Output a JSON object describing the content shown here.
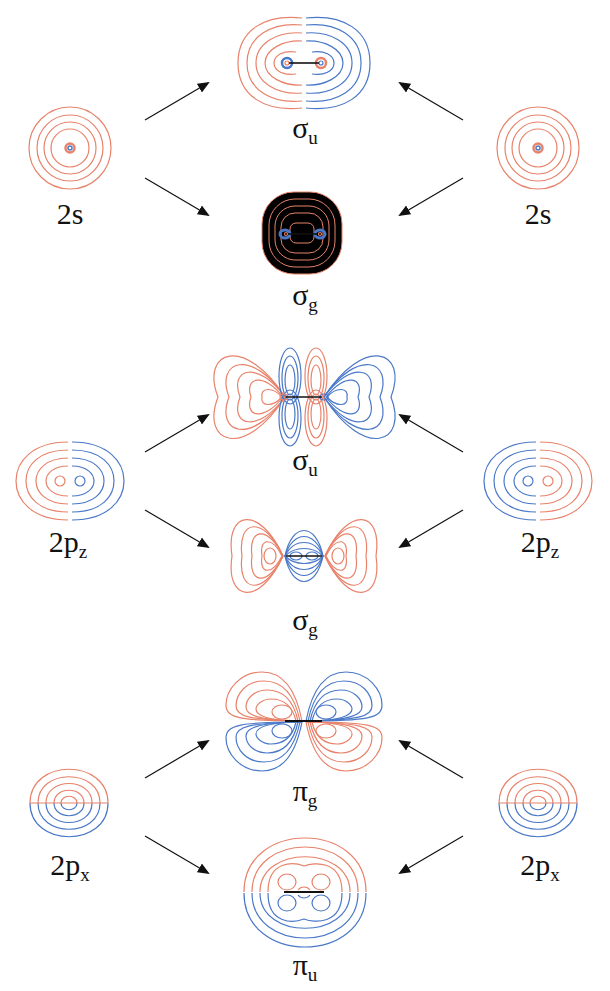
{
  "colors": {
    "positive_phase": "#e8826a",
    "negative_phase": "#4a78c8",
    "arrow": "#111111",
    "background": "#ffffff"
  },
  "rows": [
    {
      "atomic_orbital": {
        "label": "2s",
        "sub": ""
      },
      "bonding_pairs": [
        {
          "label": "σ",
          "sub": "u",
          "position": "top"
        },
        {
          "label": "σ",
          "sub": "g",
          "position": "bottom"
        }
      ]
    },
    {
      "atomic_orbital": {
        "label": "2p",
        "sub": "z"
      },
      "bonding_pairs": [
        {
          "label": "σ",
          "sub": "u",
          "position": "top"
        },
        {
          "label": "σ",
          "sub": "g",
          "position": "bottom"
        }
      ]
    },
    {
      "atomic_orbital": {
        "label": "2p",
        "sub": "x"
      },
      "bonding_pairs": [
        {
          "label": "π",
          "sub": "g",
          "position": "top"
        },
        {
          "label": "π",
          "sub": "u",
          "position": "bottom"
        }
      ]
    }
  ],
  "labels": {
    "r1_left": {
      "main": "2s",
      "sub": ""
    },
    "r1_right": {
      "main": "2s",
      "sub": ""
    },
    "r1_top": {
      "main": "σ",
      "sub": "u"
    },
    "r1_bot": {
      "main": "σ",
      "sub": "g"
    },
    "r2_left": {
      "main": "2p",
      "sub": "z"
    },
    "r2_right": {
      "main": "2p",
      "sub": "z"
    },
    "r2_top": {
      "main": "σ",
      "sub": "u"
    },
    "r2_bot": {
      "main": "σ",
      "sub": "g"
    },
    "r3_left": {
      "main": "2p",
      "sub": "x"
    },
    "r3_right": {
      "main": "2p",
      "sub": "x"
    },
    "r3_top": {
      "main": "π",
      "sub": "g"
    },
    "r3_bot": {
      "main": "π",
      "sub": "u"
    }
  }
}
